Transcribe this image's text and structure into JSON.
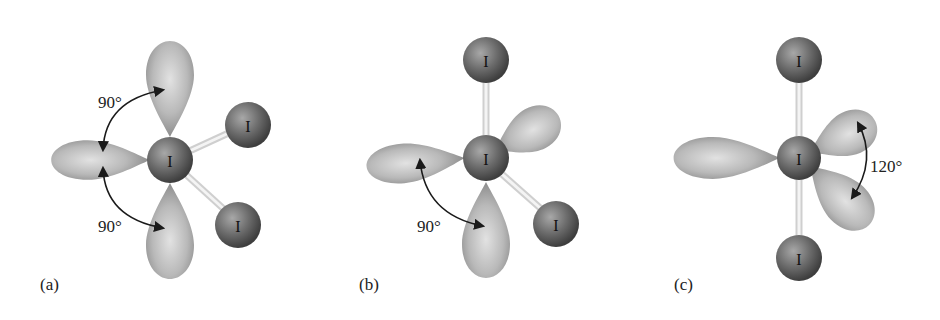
{
  "figure": {
    "colors": {
      "lobe": "#b8b8b8",
      "atom": "#6f6f6f",
      "bond": "#d8d8d8",
      "text": "#1a1a1a",
      "background": "#ffffff"
    },
    "panels": [
      {
        "label": "(a)",
        "central_atom": "I",
        "bonded_atoms": [
          "I",
          "I"
        ],
        "lone_pairs": 3,
        "angles": [
          {
            "value": "90°"
          },
          {
            "value": "90°"
          }
        ]
      },
      {
        "label": "(b)",
        "central_atom": "I",
        "bonded_atoms": [
          "I",
          "I"
        ],
        "lone_pairs": 3,
        "angles": [
          {
            "value": "90°"
          }
        ]
      },
      {
        "label": "(c)",
        "central_atom": "I",
        "bonded_atoms": [
          "I",
          "I"
        ],
        "lone_pairs": 3,
        "angles": [
          {
            "value": "120°"
          }
        ]
      }
    ]
  }
}
